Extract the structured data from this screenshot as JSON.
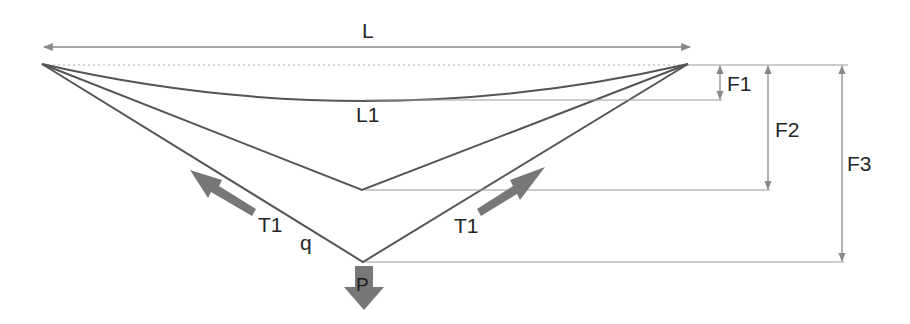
{
  "diagram": {
    "colors": {
      "line": "#555555",
      "dimension": "#8a8a8a",
      "dotted": "#b0b0b0",
      "force_arrow": "#777777",
      "text": "#262626",
      "background": "#ffffff"
    },
    "labels": {
      "span": "L",
      "cable_length": "L1",
      "sag_1": "F1",
      "sag_2": "F2",
      "sag_3": "F3",
      "tension_left": "T1",
      "tension_right": "T1",
      "distributed_load": "q",
      "point_load": "P"
    },
    "elements": [
      {
        "id": "span-dimension",
        "kind": "dimension",
        "label": "L"
      },
      {
        "id": "catenary-curve",
        "kind": "curve",
        "label": "L1"
      },
      {
        "id": "middle-v-cable",
        "kind": "polyline"
      },
      {
        "id": "lower-v-cable",
        "kind": "polyline"
      },
      {
        "id": "sag-f1",
        "kind": "dimension",
        "label": "F1"
      },
      {
        "id": "sag-f2",
        "kind": "dimension",
        "label": "F2"
      },
      {
        "id": "sag-f3",
        "kind": "dimension",
        "label": "F3"
      },
      {
        "id": "tension-left",
        "kind": "force-arrow",
        "label": "T1"
      },
      {
        "id": "tension-right",
        "kind": "force-arrow",
        "label": "T1"
      },
      {
        "id": "point-load",
        "kind": "force-arrow",
        "label": "P"
      }
    ]
  }
}
